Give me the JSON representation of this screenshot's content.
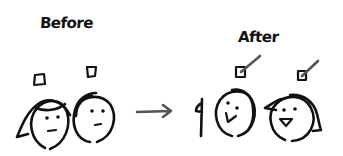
{
  "labels": {
    "before": "Before",
    "after": "After"
  },
  "colors": {
    "ink": "#111111",
    "arrow": "#555555",
    "checkmark": "#555555",
    "background": "#ffffff"
  },
  "panels": {
    "before": {
      "people": [
        {
          "hair": "long",
          "expression": "neutral",
          "checkbox": "unchecked"
        },
        {
          "hair": "short",
          "expression": "neutral",
          "checkbox": "unchecked"
        }
      ]
    },
    "transition": {
      "icon": "arrow-right-icon"
    },
    "after": {
      "extra": "raised-hand",
      "people": [
        {
          "hair": "short",
          "expression": "happy",
          "checkbox": "checked"
        },
        {
          "hair": "long",
          "expression": "happy",
          "checkbox": "checked"
        }
      ]
    }
  }
}
